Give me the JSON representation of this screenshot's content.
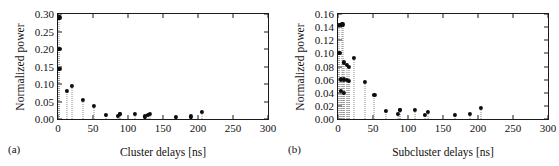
{
  "figure": {
    "panels": [
      {
        "tag": "(a)",
        "ylabel": "Normalized power",
        "xlabel": "Cluster delays [ns]"
      },
      {
        "tag": "(b)",
        "ylabel": "Normalized power",
        "xlabel": "Subcluster delays [ns]"
      }
    ]
  },
  "chart_data": [
    {
      "type": "scatter",
      "panel": "(a)",
      "title": "",
      "xlabel": "Cluster delays [ns]",
      "ylabel": "Normalized power",
      "xlim": [
        0,
        300
      ],
      "ylim": [
        0.0,
        0.3
      ],
      "xticks": [
        0,
        50,
        100,
        150,
        200,
        250,
        300
      ],
      "xtick_labels": [
        "0",
        "50",
        "100",
        "150",
        "200",
        "250",
        "300"
      ],
      "yticks": [
        0.0,
        0.05,
        0.1,
        0.15,
        0.2,
        0.25,
        0.3
      ],
      "ytick_labels": [
        "0.00",
        "0.05",
        "0.10",
        "0.15",
        "0.20",
        "0.25",
        "0.30"
      ],
      "grid": false,
      "legend": "none",
      "style": "stem-with-dotted-lines",
      "marker": "filled-circle",
      "marker_color": "#0d0d0d",
      "stem_color": "#8a8a8a",
      "x": [
        2,
        2,
        2,
        13,
        20,
        35,
        51,
        69,
        85,
        88,
        89,
        110,
        124,
        129,
        131,
        169,
        190,
        206
      ],
      "y": [
        0.29,
        0.2,
        0.143,
        0.079,
        0.094,
        0.055,
        0.036,
        0.012,
        0.008,
        0.013,
        0.013,
        0.014,
        0.007,
        0.011,
        0.013,
        0.006,
        0.007,
        0.019
      ]
    },
    {
      "type": "scatter",
      "panel": "(b)",
      "title": "",
      "xlabel": "Subcluster delays [ns]",
      "ylabel": "Normalized power",
      "xlim": [
        0,
        300
      ],
      "ylim": [
        0.0,
        0.16
      ],
      "xticks": [
        0,
        50,
        100,
        150,
        200,
        250,
        300
      ],
      "xtick_labels": [
        "0",
        "50",
        "100",
        "150",
        "200",
        "250",
        "300"
      ],
      "yticks": [
        0.0,
        0.02,
        0.04,
        0.06,
        0.08,
        0.1,
        0.12,
        0.14,
        0.16
      ],
      "ytick_labels": [
        "0.00",
        "0.02",
        "0.04",
        "0.06",
        "0.08",
        "0.10",
        "0.12",
        "0.14",
        "0.16"
      ],
      "grid": false,
      "legend": "none",
      "style": "stem-with-dotted-lines",
      "marker": "filled-circle",
      "marker_color": "#0d0d0d",
      "stem_color": "#8a8a8a",
      "x": [
        2,
        5,
        7,
        2,
        9,
        13,
        16,
        4,
        9,
        13,
        16,
        23,
        4,
        9,
        38,
        52,
        69,
        86,
        88,
        89,
        110,
        124,
        129,
        167,
        189,
        204
      ],
      "y": [
        0.143,
        0.144,
        0.144,
        0.1,
        0.086,
        0.082,
        0.079,
        0.06,
        0.06,
        0.059,
        0.058,
        0.093,
        0.043,
        0.04,
        0.056,
        0.037,
        0.012,
        0.008,
        0.013,
        0.013,
        0.014,
        0.006,
        0.011,
        0.006,
        0.007,
        0.017
      ]
    }
  ]
}
